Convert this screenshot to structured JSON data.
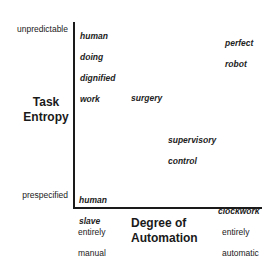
{
  "diagram": {
    "y_axis": {
      "title_line1": "Task",
      "title_line2": "Entropy",
      "top_label": "unpredictable",
      "bottom_label": "prespecified"
    },
    "x_axis": {
      "title_line1": "Degree of",
      "title_line2": "Automation",
      "left_label_line1": "entirely",
      "left_label_line2": "manual",
      "right_label_line1": "entirely",
      "right_label_line2": "automatic"
    },
    "points": [
      {
        "id": "human-doing-dignified-work",
        "lines": [
          "human",
          "doing",
          "dignified",
          "work"
        ]
      },
      {
        "id": "perfect-robot",
        "lines": [
          "perfect",
          "robot"
        ]
      },
      {
        "id": "surgery",
        "lines": [
          "surgery"
        ]
      },
      {
        "id": "supervisory-control",
        "lines": [
          "supervisory",
          "control"
        ]
      },
      {
        "id": "human-slave",
        "lines": [
          "human",
          "slave"
        ]
      },
      {
        "id": "clockwork",
        "lines": [
          "clockwork"
        ]
      }
    ],
    "colors": {
      "axis": "#1a1a1a",
      "text": "#1a1a1a",
      "background": "#ffffff"
    }
  }
}
